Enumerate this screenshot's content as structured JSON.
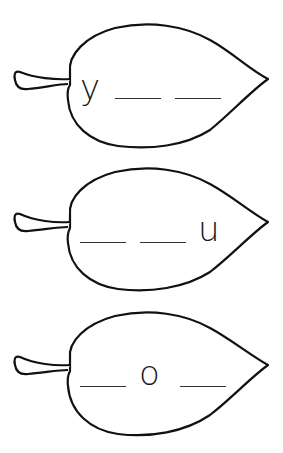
{
  "worksheet": {
    "leaves": [
      {
        "slots": [
          "y",
          "",
          ""
        ],
        "known_letter": "y",
        "pattern": "y _ _"
      },
      {
        "slots": [
          "",
          "",
          "u"
        ],
        "known_letter": "u",
        "pattern": "_ _ u"
      },
      {
        "slots": [
          "",
          "o",
          ""
        ],
        "known_letter": "o",
        "pattern": "_ o _"
      }
    ],
    "colors": {
      "outline": "#111111",
      "background": "#ffffff",
      "blank_line": "#333333"
    }
  }
}
